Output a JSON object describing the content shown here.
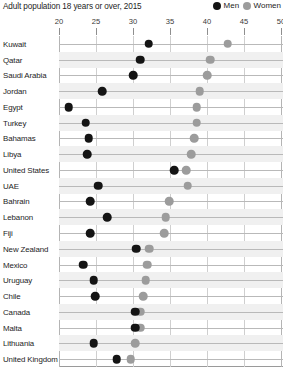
{
  "header": {
    "title": "Adult population 18 years or over, 2015",
    "legend": [
      {
        "label": "Men",
        "color": "#141414",
        "icon": "filled-circle-icon"
      },
      {
        "label": "Women",
        "color": "#9c9c9c",
        "icon": "filled-circle-icon"
      }
    ]
  },
  "chart_data": {
    "type": "scatter",
    "subtype": "dot-plot",
    "title": "Adult population 18 years or over, 2015",
    "xlabel": "",
    "ylabel": "",
    "xlim": [
      20,
      50
    ],
    "xticks": [
      20,
      25,
      30,
      35,
      40,
      45,
      50
    ],
    "xtick_labels": [
      "20",
      "25",
      "30",
      "35",
      "40",
      "45",
      "50"
    ],
    "grid": true,
    "grid_axis": "both",
    "legend_position": "top-right",
    "categories": [
      "Kuwait",
      "Qatar",
      "Saudi Arabia",
      "Jordan",
      "Egypt",
      "Turkey",
      "Bahamas",
      "Libya",
      "United States",
      "UAE",
      "Bahrain",
      "Lebanon",
      "Fiji",
      "New Zealand",
      "Mexico",
      "Uruguay",
      "Chile",
      "Canada",
      "Malta",
      "Lithuania",
      "United Kingdom"
    ],
    "series": [
      {
        "name": "Men",
        "color": "#141414",
        "values": [
          32.1,
          31.0,
          30.0,
          25.8,
          21.3,
          23.6,
          24.0,
          23.8,
          35.6,
          25.3,
          24.2,
          26.5,
          24.2,
          30.4,
          23.3,
          24.7,
          24.9,
          30.3,
          30.3,
          24.7,
          27.8
        ]
      },
      {
        "name": "Women",
        "color": "#9c9c9c",
        "values": [
          42.8,
          40.4,
          40.0,
          39.0,
          38.6,
          38.6,
          38.3,
          37.9,
          37.2,
          37.4,
          34.9,
          34.4,
          34.2,
          32.2,
          31.9,
          31.7,
          31.4,
          31.0,
          31.0,
          30.3,
          29.7
        ]
      }
    ]
  }
}
